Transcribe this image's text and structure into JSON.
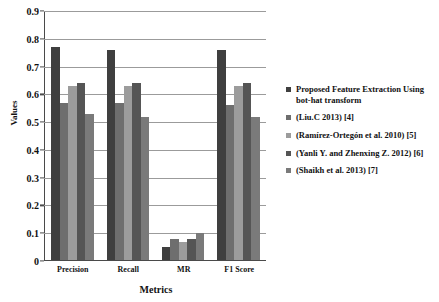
{
  "chart_data": {
    "type": "bar",
    "title": "",
    "xlabel": "Metrics",
    "ylabel": "Values",
    "categories": [
      "Precision",
      "Recall",
      "MR",
      "F1 Score"
    ],
    "ylim": [
      0,
      0.9
    ],
    "yticks": [
      "0",
      "0.1",
      "0.2",
      "0.3",
      "0.4",
      "0.5",
      "0.6",
      "0.7",
      "0.8",
      "0.9"
    ],
    "ytick_values": [
      0,
      0.1,
      0.2,
      0.3,
      0.4,
      0.5,
      0.6,
      0.7,
      0.8,
      0.9
    ],
    "grid": true,
    "legend_position": "right",
    "series": [
      {
        "name": "Proposed Feature Extraction Using bot-hat transform",
        "color": "#3f3f3f",
        "values": [
          0.77,
          0.76,
          0.05,
          0.76
        ]
      },
      {
        "name": "(Liu.C 2013) [4]",
        "color": "#6e6e6e",
        "values": [
          0.57,
          0.57,
          0.08,
          0.56
        ]
      },
      {
        "name": "(Ramírez-Ortegón et al. 2010) [5]",
        "color": "#9c9c9c",
        "values": [
          0.63,
          0.63,
          0.07,
          0.63
        ]
      },
      {
        "name": "(Yanli Y. and Zhenxing Z. 2012) [6]",
        "color": "#555555",
        "values": [
          0.64,
          0.64,
          0.08,
          0.64
        ]
      },
      {
        "name": "(Shaikh et al. 2013) [7]",
        "color": "#7a7a7a",
        "values": [
          0.53,
          0.52,
          0.1,
          0.52
        ]
      }
    ]
  },
  "axes": {
    "y_title": "Values",
    "x_title": "Metrics"
  }
}
